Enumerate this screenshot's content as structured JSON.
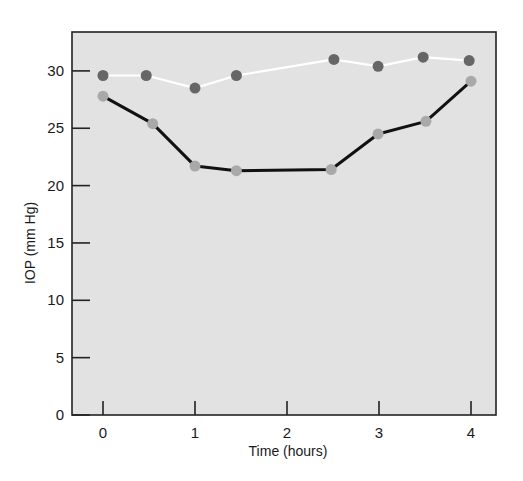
{
  "chart_data": {
    "type": "line",
    "title": "",
    "xlabel": "Time (hours)",
    "ylabel": "IOP (mm Hg)",
    "xlim": [
      -0.34,
      4.27
    ],
    "ylim": [
      0,
      33.4
    ],
    "xticks": [
      0,
      1,
      2,
      3,
      4
    ],
    "yticks": [
      0,
      5,
      10,
      15,
      20,
      25,
      30
    ],
    "grid": false,
    "legend": null,
    "plot_background": "#e2e2e2",
    "series": [
      {
        "name": "upper series (white line, dark markers)",
        "line_color": "#ffffff",
        "marker_color": "#666666",
        "x": [
          0,
          0.47,
          1.0,
          1.45,
          2.51,
          2.99,
          3.48,
          3.98
        ],
        "y": [
          29.6,
          29.6,
          28.5,
          29.6,
          31.0,
          30.4,
          31.2,
          30.9
        ]
      },
      {
        "name": "lower series (black line, light markers)",
        "line_color": "#111111",
        "marker_color": "#a9a9a9",
        "x": [
          0,
          0.54,
          1.0,
          1.45,
          2.48,
          2.99,
          3.51,
          4.0
        ],
        "y": [
          27.8,
          25.4,
          21.7,
          21.3,
          21.4,
          24.5,
          25.6,
          29.1
        ]
      }
    ]
  }
}
